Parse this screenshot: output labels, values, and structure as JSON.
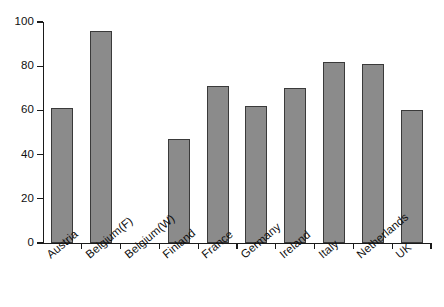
{
  "chart_data": {
    "type": "bar",
    "title": "",
    "subtitle": "",
    "xlabel": "",
    "ylabel": "",
    "categories": [
      "Austria",
      "Belgium(F)",
      "Belgium(W)",
      "Finland",
      "France",
      "Germany",
      "Ireland",
      "Italy",
      "Netherlands",
      "UK"
    ],
    "values": [
      61,
      96,
      0,
      47,
      71,
      62,
      70,
      82,
      81,
      60
    ],
    "series": [
      {
        "name": "",
        "values": [
          61,
          96,
          0,
          47,
          71,
          62,
          70,
          82,
          81,
          60
        ]
      }
    ],
    "ylim": [
      0,
      100
    ],
    "ytick_labels": [
      "0",
      "20",
      "40",
      "60",
      "80",
      "100"
    ],
    "ytick_values": [
      0,
      20,
      40,
      60,
      80,
      100
    ],
    "grid": false,
    "legend": null,
    "legend_position": "none",
    "annotations": [],
    "bar_fill_color": "#8b8b8b",
    "bar_border_color": "#3a3a3a",
    "axis_color": "#1a1a1a",
    "background_color": "#ffffff"
  }
}
